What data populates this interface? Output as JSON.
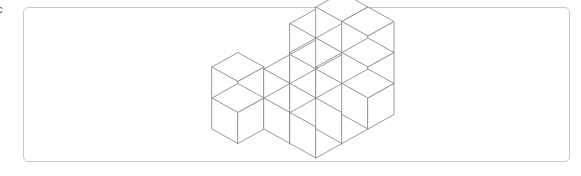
{
  "page": {
    "width": 581,
    "height": 176,
    "background_color": "#ffffff",
    "edge_fragment_text": "c"
  },
  "frame": {
    "border_color": "#c9c9c9",
    "fill_color": "#ffffff",
    "corner_radius": 5,
    "x": 23,
    "y": 7,
    "width": 547,
    "height": 155
  },
  "figure": {
    "title": "",
    "kind": "isometric-cube-stack",
    "line_color": "#8d8d8d",
    "face_color": "#ffffff",
    "stroke_width": 0.9,
    "projection": "isometric",
    "cube_size_px": 34,
    "origin": {
      "x": 212,
      "y": 129
    },
    "axis": {
      "u_dx": 26.0,
      "u_dy": -14.5,
      "v_dx": 26.0,
      "v_dy": 14.5,
      "w_dx": 0.0,
      "w_dy": -31.0
    },
    "description": "Stack of unit cubes arranged as a rising staircase on a 4 by 3 footprint",
    "total_cubes": 22,
    "footprint_cols": 4,
    "footprint_rows": 3,
    "max_height": 3,
    "column_heights": [
      [
        2,
        0,
        0
      ],
      [
        0,
        1,
        2
      ],
      [
        1,
        2,
        2
      ],
      [
        2,
        3,
        3
      ]
    ],
    "cubes": [
      {
        "x": 0,
        "y": 0,
        "z": 0
      },
      {
        "x": 0,
        "y": 0,
        "z": 1
      },
      {
        "x": 1,
        "y": 1,
        "z": 0
      },
      {
        "x": 1,
        "y": 2,
        "z": 0
      },
      {
        "x": 1,
        "y": 2,
        "z": 1
      },
      {
        "x": 2,
        "y": 0,
        "z": 0
      },
      {
        "x": 2,
        "y": 1,
        "z": 0
      },
      {
        "x": 2,
        "y": 1,
        "z": 1
      },
      {
        "x": 2,
        "y": 2,
        "z": 0
      },
      {
        "x": 2,
        "y": 2,
        "z": 1
      },
      {
        "x": 3,
        "y": 0,
        "z": 0
      },
      {
        "x": 3,
        "y": 0,
        "z": 1
      },
      {
        "x": 3,
        "y": 1,
        "z": 0
      },
      {
        "x": 3,
        "y": 1,
        "z": 1
      },
      {
        "x": 3,
        "y": 1,
        "z": 2
      },
      {
        "x": 3,
        "y": 2,
        "z": 0
      },
      {
        "x": 3,
        "y": 2,
        "z": 1
      },
      {
        "x": 3,
        "y": 2,
        "z": 2
      }
    ]
  }
}
